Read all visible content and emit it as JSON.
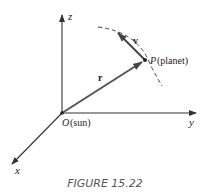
{
  "figure": {
    "caption": "FIGURE 15.22",
    "axes": {
      "z_label": "z",
      "y_label": "y",
      "x_label": "x"
    },
    "origin": {
      "label_letter": "O",
      "label_desc": "(sun)"
    },
    "point": {
      "label_letter": "P",
      "label_desc": "(planet)"
    },
    "vectors": {
      "position": "r",
      "velocity": "v"
    },
    "colors": {
      "axis": "#333333",
      "vector": "#555555",
      "orbit": "#444444",
      "caption": "#555555"
    }
  }
}
